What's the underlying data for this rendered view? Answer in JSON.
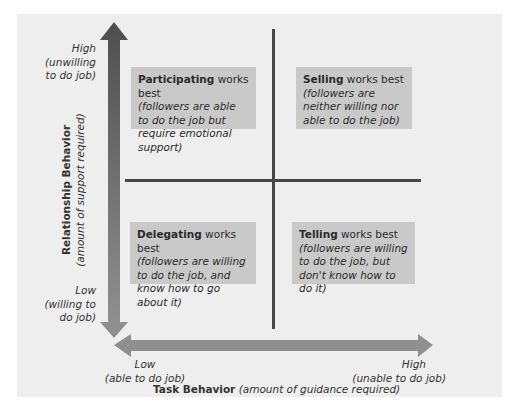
{
  "diagram": {
    "type": "quadrant",
    "y_axis": {
      "title": "Relationship Behavior",
      "subtitle": "(amount of support required)",
      "high_label": "High",
      "high_sub_1": "(unwilling",
      "high_sub_2": "to do job)",
      "low_label": "Low",
      "low_sub_1": "(willing to",
      "low_sub_2": "do job)"
    },
    "x_axis": {
      "title": "Task Behavior",
      "subtitle": "(amount of guidance required)",
      "low_label": "Low",
      "low_sub": "(able to do job)",
      "high_label": "High",
      "high_sub": "(unable to do job)"
    },
    "quadrants": [
      {
        "position": "top-left",
        "style": "Participating",
        "suffix": " works best",
        "desc": "(followers are able to do the job but require emotional support)"
      },
      {
        "position": "top-right",
        "style": "Selling",
        "suffix": " works best",
        "desc": "(followers are neither willing nor able to do the job)"
      },
      {
        "position": "bottom-left",
        "style": "Delegating",
        "suffix": " works best",
        "desc": "(followers are willing to do the job, and know how to go about it)"
      },
      {
        "position": "bottom-right",
        "style": "Telling",
        "suffix": " works best",
        "desc": "(followers are willing to do the job, but don't know how to do it)"
      }
    ],
    "colors": {
      "background": "#eeeeee",
      "box": "#c9c9c9",
      "arrow_dark": "#555555",
      "arrow_light": "#8a8a8a",
      "divider": "#474747"
    }
  }
}
